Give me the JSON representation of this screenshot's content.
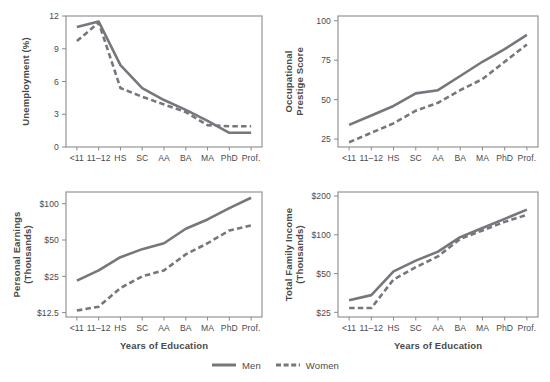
{
  "figure": {
    "series_colors": {
      "men": "#77767c",
      "women": "#77767c"
    },
    "legend": {
      "position": "bottom-center",
      "entries": [
        {
          "name": "men",
          "label": "Men",
          "style": "solid"
        },
        {
          "name": "women",
          "label": "Women",
          "style": "dashed"
        }
      ]
    },
    "shared_x_axis_label": "Years of Education",
    "categories": [
      "<11",
      "11–12",
      "HS",
      "SC",
      "AA",
      "BA",
      "MA",
      "PhD",
      "Prof."
    ]
  },
  "chart_data": [
    {
      "id": "unemployment",
      "type": "line",
      "title": "",
      "xlabel": "",
      "ylabel": "Unemployment (%)",
      "categories": [
        "<11",
        "11–12",
        "HS",
        "SC",
        "AA",
        "BA",
        "MA",
        "PhD",
        "Prof."
      ],
      "yticks": [
        0,
        3,
        6,
        9,
        12
      ],
      "yticklabels": [
        "0",
        "3",
        "6",
        "9",
        "12"
      ],
      "ylim": [
        0,
        12
      ],
      "yscale": "linear",
      "grid": false,
      "series": [
        {
          "name": "Men",
          "style": "solid",
          "values": [
            11.0,
            11.5,
            7.5,
            5.4,
            4.3,
            3.4,
            2.4,
            1.3,
            1.3
          ]
        },
        {
          "name": "Women",
          "style": "dashed",
          "values": [
            9.7,
            11.4,
            5.4,
            4.6,
            3.9,
            3.2,
            2.0,
            1.9,
            1.9
          ]
        }
      ]
    },
    {
      "id": "occupational-prestige",
      "type": "line",
      "title": "",
      "xlabel": "",
      "ylabel": "Occupational Prestige Score",
      "ylabel_lines": [
        "Occupational",
        "Prestige Score"
      ],
      "categories": [
        "<11",
        "11–12",
        "HS",
        "SC",
        "AA",
        "BA",
        "MA",
        "PhD",
        "Prof."
      ],
      "yticks": [
        25,
        50,
        75,
        100
      ],
      "yticklabels": [
        "25",
        "50",
        "75",
        "100"
      ],
      "ylim": [
        20,
        103
      ],
      "yscale": "linear",
      "grid": false,
      "series": [
        {
          "name": "Men",
          "style": "solid",
          "values": [
            34,
            40,
            46,
            54,
            56,
            65,
            74,
            82,
            91
          ]
        },
        {
          "name": "Women",
          "style": "dashed",
          "values": [
            23,
            29,
            35,
            43,
            48,
            56,
            63,
            74,
            85
          ]
        }
      ]
    },
    {
      "id": "personal-earnings",
      "type": "line",
      "title": "",
      "xlabel": "Years of Education",
      "ylabel": "Personal Earnings (Thousands)",
      "ylabel_lines": [
        "Personal Earnings",
        "(Thousands)"
      ],
      "categories": [
        "<11",
        "11–12",
        "HS",
        "SC",
        "AA",
        "BA",
        "MA",
        "PhD",
        "Prof."
      ],
      "yticks": [
        12.5,
        25,
        50,
        100
      ],
      "yticklabels": [
        "$12.5",
        "$25",
        "$50",
        "$100"
      ],
      "ylim": [
        11.5,
        125
      ],
      "yscale": "log",
      "grid": false,
      "series": [
        {
          "name": "Men",
          "style": "solid",
          "values": [
            23,
            28,
            36,
            42,
            47,
            62,
            74,
            92,
            112
          ]
        },
        {
          "name": "Women",
          "style": "dashed",
          "values": [
            13,
            14,
            20,
            25,
            28,
            38,
            47,
            60,
            66
          ]
        }
      ]
    },
    {
      "id": "total-family-income",
      "type": "line",
      "title": "",
      "xlabel": "Years of Education",
      "ylabel": "Total Family Income (Thousands)",
      "ylabel_lines": [
        "Total Family Income",
        "(Thousands)"
      ],
      "categories": [
        "<11",
        "11–12",
        "HS",
        "SC",
        "AA",
        "BA",
        "MA",
        "PhD",
        "Prof."
      ],
      "yticks": [
        25,
        50,
        100,
        200
      ],
      "yticklabels": [
        "$25",
        "$50",
        "$100",
        "$200"
      ],
      "ylim": [
        23,
        215
      ],
      "yscale": "log",
      "grid": false,
      "series": [
        {
          "name": "Men",
          "style": "solid",
          "values": [
            31,
            34,
            52,
            63,
            74,
            96,
            113,
            133,
            157
          ]
        },
        {
          "name": "Women",
          "style": "dashed",
          "values": [
            27,
            27,
            45,
            56,
            68,
            93,
            108,
            126,
            143
          ]
        }
      ]
    }
  ]
}
